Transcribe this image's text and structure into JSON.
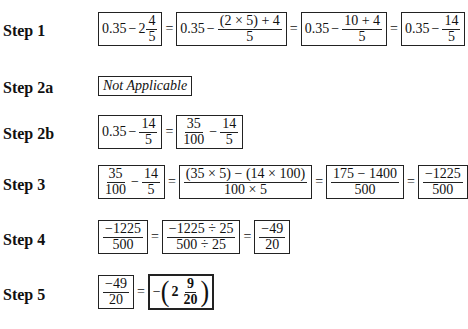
{
  "steps": [
    {
      "label": "Step 1"
    },
    {
      "label": "Step 2a"
    },
    {
      "label": "Step 2b"
    },
    {
      "label": "Step 3"
    },
    {
      "label": "Step 4"
    },
    {
      "label": "Step 5"
    }
  ],
  "eq": "=",
  "minus": "−",
  "step1": {
    "b1": {
      "whole": "0.35",
      "mixed_whole": "2",
      "num": "4",
      "den": "5"
    },
    "b2": {
      "whole": "0.35",
      "num": "(2 × 5) + 4",
      "den": "5"
    },
    "b3": {
      "whole": "0.35",
      "num": "10 + 4",
      "den": "5"
    },
    "b4": {
      "whole": "0.35",
      "num": "14",
      "den": "5"
    }
  },
  "step2a": {
    "text": "Not Applicable"
  },
  "step2b": {
    "b1": {
      "whole": "0.35",
      "num": "14",
      "den": "5"
    },
    "b2": {
      "num1": "35",
      "den1": "100",
      "num2": "14",
      "den2": "5"
    }
  },
  "step3": {
    "b1": {
      "num1": "35",
      "den1": "100",
      "num2": "14",
      "den2": "5"
    },
    "b2": {
      "num": "(35 × 5) − (14 × 100)",
      "den": "100 × 5"
    },
    "b3": {
      "num": "175 − 1400",
      "den": "500"
    },
    "b4": {
      "num": "−1225",
      "den": "500"
    }
  },
  "step4": {
    "b1": {
      "num": "−1225",
      "den": "500"
    },
    "b2": {
      "num": "−1225 ÷ 25",
      "den": "500 ÷ 25"
    },
    "b3": {
      "num": "−49",
      "den": "20"
    }
  },
  "step5": {
    "b1": {
      "num": "−49",
      "den": "20"
    },
    "b2": {
      "sign": "−",
      "lparen": "(",
      "whole": "2",
      "num": "9",
      "den": "20",
      "rparen": ")"
    }
  }
}
